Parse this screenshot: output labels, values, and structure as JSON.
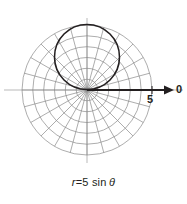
{
  "figure": {
    "type": "polar-plot",
    "background_color": "#ffffff",
    "grid_color": "#8a8a8a",
    "curve_color": "#231f20",
    "axis_color": "#231f20",
    "pole": {
      "x": 87,
      "y": 90
    },
    "polar_axis": {
      "label": "0",
      "tick_label": "5",
      "arrow": "right-arrow-icon",
      "direction": "east"
    },
    "grid": {
      "radial_spoke_interval_degrees": 15,
      "radial_spoke_count": 24,
      "circle_count": 6,
      "circle_radii_px": [
        10.8,
        21.7,
        32.5,
        43.3,
        54.2,
        65
      ],
      "outer_radius_px": 65
    },
    "curve": {
      "equation": "r = 5 sin(theta)",
      "shape": "circle",
      "center_px": {
        "x": 87,
        "y": 57
      },
      "radius_px": 32.5
    }
  },
  "caption": {
    "variable": "r",
    "equals": "=",
    "expression": "5 sin",
    "theta": "θ",
    "full_text": "r = 5 sin θ"
  },
  "chart_data": {
    "type": "line",
    "coordinate_system": "polar",
    "equation": "r = 5 sin(theta)",
    "xlabel": "",
    "ylabel": "",
    "legend": [],
    "grid": true,
    "axis_tick_labels": [
      "5"
    ],
    "axis_end_label": "0",
    "r_max": 6,
    "r_ticks": [
      1,
      2,
      3,
      4,
      5,
      6
    ],
    "theta_grid_step_degrees": 15,
    "series": [
      {
        "name": "r = 5 sin θ",
        "theta_degrees": [
          0,
          15,
          30,
          45,
          60,
          75,
          90,
          105,
          120,
          135,
          150,
          165,
          180
        ],
        "r_values": [
          0,
          1.29,
          2.5,
          3.54,
          4.33,
          4.83,
          5,
          4.83,
          4.33,
          3.54,
          2.5,
          1.29,
          0
        ]
      }
    ]
  }
}
